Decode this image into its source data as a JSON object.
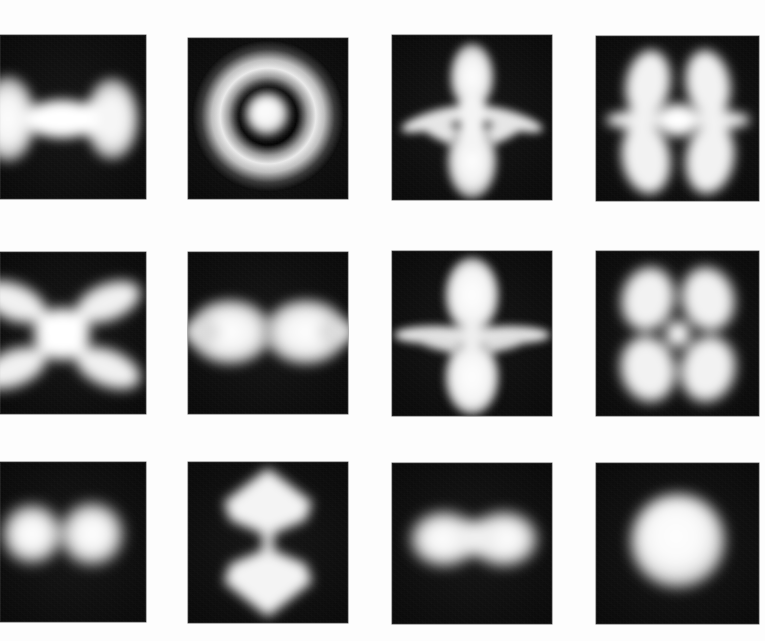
{
  "figure": {
    "kind": "photoionization-microscopy-image-grid",
    "bleed_text": "",
    "grid": {
      "rows": 3,
      "cols": 4
    },
    "colors": {
      "paper": "#fdfdfd",
      "plate_background": "#070707",
      "emission_bright": "#ffffff",
      "emission_mid": "#d8d8d8",
      "emission_dim": "#6a6a6a"
    },
    "panels": [
      {
        "id": "r1c1",
        "row": 1,
        "col": 1,
        "pattern": "horizontal-dumbbell",
        "label": "",
        "x": 0,
        "y": 35,
        "w": 146,
        "h": 164,
        "clipped_left": true
      },
      {
        "id": "r1c2",
        "row": 1,
        "col": 2,
        "pattern": "annular-ring-with-central-disk",
        "label": "",
        "x": 188,
        "y": 38,
        "w": 160,
        "h": 161
      },
      {
        "id": "r1c3",
        "row": 1,
        "col": 3,
        "pattern": "six-lobe-vertical-dumbbell-with-four-diagonal-lobes",
        "label": "",
        "x": 392,
        "y": 35,
        "w": 160,
        "h": 165
      },
      {
        "id": "r1c4",
        "row": 1,
        "col": 4,
        "pattern": "bowtie-with-horizontal-lobes",
        "label": "",
        "x": 596,
        "y": 36,
        "w": 163,
        "h": 165
      },
      {
        "id": "r2c1",
        "row": 2,
        "col": 1,
        "pattern": "x-shaped-four-lobe-cross",
        "label": "",
        "x": 0,
        "y": 252,
        "w": 146,
        "h": 162,
        "clipped_left": true
      },
      {
        "id": "r2c2",
        "row": 2,
        "col": 2,
        "pattern": "horizontal-double-lobe-figure-eight",
        "label": "",
        "x": 188,
        "y": 252,
        "w": 160,
        "h": 162
      },
      {
        "id": "r2c3",
        "row": 2,
        "col": 3,
        "pattern": "vertical-dumbbell-with-horizontal-side-lobes",
        "label": "",
        "x": 392,
        "y": 251,
        "w": 160,
        "h": 165
      },
      {
        "id": "r2c4",
        "row": 2,
        "col": 4,
        "pattern": "butterfly-four-lobe-hourglass",
        "label": "",
        "x": 596,
        "y": 251,
        "w": 163,
        "h": 165
      },
      {
        "id": "r3c1",
        "row": 3,
        "col": 1,
        "pattern": "two-horizontal-round-blobs",
        "label": "",
        "x": 0,
        "y": 462,
        "w": 146,
        "h": 160,
        "clipped_left": true
      },
      {
        "id": "r3c2",
        "row": 3,
        "col": 2,
        "pattern": "vertical-stacked-diamonds-hourglass",
        "label": "",
        "x": 188,
        "y": 462,
        "w": 160,
        "h": 161
      },
      {
        "id": "r3c3",
        "row": 3,
        "col": 3,
        "pattern": "two-horizontal-merged-ovals",
        "label": "",
        "x": 392,
        "y": 463,
        "w": 160,
        "h": 161
      },
      {
        "id": "r3c4",
        "row": 3,
        "col": 4,
        "pattern": "single-round-central-blob",
        "label": "",
        "x": 596,
        "y": 463,
        "w": 163,
        "h": 161
      }
    ]
  }
}
